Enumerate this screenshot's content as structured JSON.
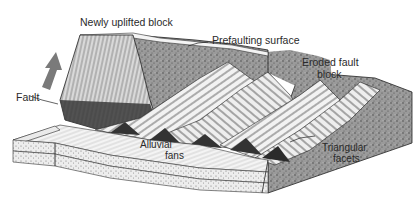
{
  "figure": {
    "type": "geologic-block-diagram"
  },
  "labels": {
    "newly_uplifted_block": "Newly uplifted block",
    "prefaulting_surface": "Prefaulting surface",
    "eroded_fault_block_line1": "Eroded fault",
    "eroded_fault_block_line2": "block",
    "fault": "Fault",
    "alluvial_fans_line1": "Alluvial",
    "alluvial_fans_line2": "fans",
    "triangular_facets_line1": "Triangular",
    "triangular_facets_line2": "facets"
  },
  "icons": {
    "uplift_arrow": "up-arrow"
  },
  "colors": {
    "stipple_fill": "#8a8a8a",
    "dark_fill": "#3a3a3a",
    "arrow": "#7a7a7a",
    "line": "#222222",
    "light_fill": "#f2f2f2"
  }
}
